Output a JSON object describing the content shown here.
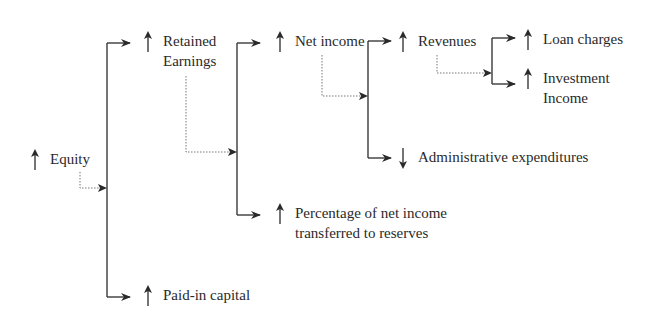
{
  "diagram": {
    "type": "tree",
    "colors": {
      "line": "#2a2a2a",
      "dotted": "#777777",
      "text": "#2a2a2a",
      "background": "#ffffff"
    },
    "nodes": {
      "equity": {
        "label": "Equity",
        "direction": "up"
      },
      "retained_earnings": {
        "line1": "Retained",
        "line2": "Earnings",
        "direction": "up"
      },
      "paid_in_capital": {
        "label": "Paid-in capital",
        "direction": "up"
      },
      "net_income": {
        "label": "Net income",
        "direction": "up"
      },
      "percentage_reserves": {
        "line1": "Percentage of net income",
        "line2": "transferred to reserves",
        "direction": "up"
      },
      "revenues": {
        "label": "Revenues",
        "direction": "up"
      },
      "administrative_expenditures": {
        "label": "Administrative expenditures",
        "direction": "down"
      },
      "loan_charges": {
        "label": "Loan charges",
        "direction": "up"
      },
      "investment_income": {
        "line1": "Investment",
        "line2": "Income",
        "direction": "up"
      }
    },
    "edges": [
      {
        "from": "equity",
        "to": "retained_earnings"
      },
      {
        "from": "equity",
        "to": "paid_in_capital"
      },
      {
        "from": "retained_earnings",
        "to": "net_income"
      },
      {
        "from": "retained_earnings",
        "to": "percentage_reserves"
      },
      {
        "from": "net_income",
        "to": "revenues"
      },
      {
        "from": "net_income",
        "to": "administrative_expenditures"
      },
      {
        "from": "revenues",
        "to": "loan_charges"
      },
      {
        "from": "revenues",
        "to": "investment_income"
      }
    ]
  }
}
